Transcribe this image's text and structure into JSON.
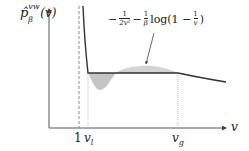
{
  "diagram": {
    "type": "maxwell-construction-plot",
    "y_axis_label": "p̂ᵛʷ_β(v)",
    "y_axis_label_parts": {
      "base": "p̂",
      "superscript": "vw",
      "subscript": "β",
      "arg": "(v)"
    },
    "x_axis_label": "v",
    "x_ticks": [
      {
        "label": "1",
        "position": "vertical asymptote (dashed)"
      },
      {
        "label": "v",
        "subscript": "l",
        "position": "liquid volume (dotted)"
      },
      {
        "label": "v",
        "subscript": "g",
        "position": "gas volume (dotted)"
      }
    ],
    "annotation": {
      "text": "−1/(2v²) − (1/β) log(1 − 1/v)",
      "parts": {
        "minus1": "−",
        "frac1_num": "1",
        "frac1_den": "2v²",
        "minus2": "−",
        "frac2_num": "1",
        "frac2_den": "β",
        "log_text": "log(1 −",
        "frac3_num": "1",
        "frac3_den": "v",
        "close": ")"
      },
      "arrow_target": "upper shaded lobe of curve"
    },
    "shaded_regions": [
      {
        "name": "lower-lobe",
        "between": [
          "v_l",
          "mid"
        ],
        "side": "below plateau"
      },
      {
        "name": "upper-lobe",
        "between": [
          "mid",
          "v_g"
        ],
        "side": "above plateau"
      }
    ],
    "colors": {
      "curve": "#333333",
      "axis": "#555555",
      "shading": "#bbbbbb",
      "asymptote": "#888888",
      "guide": "#aaaaaa"
    }
  }
}
